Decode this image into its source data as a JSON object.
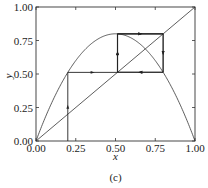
{
  "chart_data": {
    "type": "line",
    "title": "",
    "caption": "(c)",
    "xlabel": "x",
    "ylabel": "y",
    "xlim": [
      0,
      1
    ],
    "ylim": [
      0,
      1
    ],
    "grid": false,
    "xticks": [
      "0.00",
      "0.25",
      "0.50",
      "0.75",
      "1.00"
    ],
    "yticks": [
      "0.00",
      "0.25",
      "0.50",
      "0.75",
      "1.00"
    ],
    "series": [
      {
        "name": "logistic map y = r x (1 - x)",
        "r": 3.2,
        "kind": "curve"
      },
      {
        "name": "diagonal y = x",
        "kind": "line",
        "points": [
          [
            0,
            0
          ],
          [
            1,
            1
          ]
        ]
      },
      {
        "name": "cobweb iteration",
        "kind": "cobweb",
        "x0": 0.2,
        "iterations": [
          0.2,
          0.512,
          0.7995,
          0.5129,
          0.7995,
          0.513,
          0.7995
        ],
        "period2_cycle": [
          0.513,
          0.7995
        ]
      }
    ]
  },
  "colors": {
    "line": "#333333",
    "axis": "#333333",
    "background": "#ffffff"
  }
}
